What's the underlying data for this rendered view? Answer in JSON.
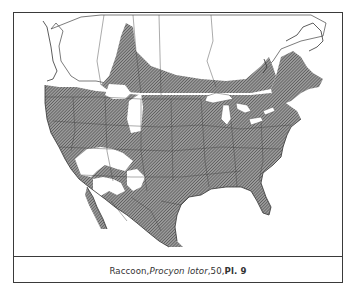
{
  "figure": {
    "type": "species-range-map",
    "region": "North America",
    "caption": {
      "common_name": "Raccoon",
      "sep1": ", ",
      "scientific_name": "Procyon lotor",
      "sep2": ", ",
      "page": "50",
      "sep3": ", ",
      "plate": "Pl. 9"
    },
    "legend": {
      "range_fill": "diagonal-hatch",
      "range_color": "#6e6e6e",
      "background_color": "#ffffff",
      "border_color": "#3a3a3a"
    }
  }
}
